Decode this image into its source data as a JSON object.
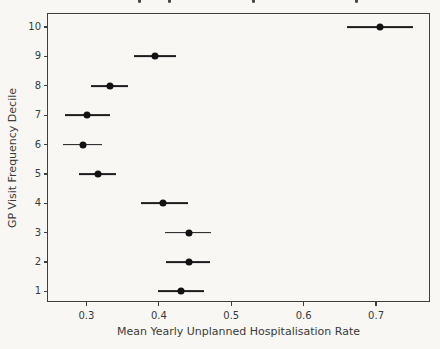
{
  "page": {
    "background_color": "#f8f7f4",
    "clipped_title": {
      "note": "title line cropped at top edge; only letter descenders visible",
      "descender_marks_x": [
        138,
        168,
        252,
        355
      ]
    }
  },
  "chart_data": {
    "type": "scatter",
    "subtype": "horizontal-errorbar",
    "title": "",
    "xlabel": "Mean Yearly Unplanned Hospitalisation Rate",
    "ylabel": "GP Visit Frequency Decile",
    "xlim": [
      0.2455,
      0.7745
    ],
    "ylim": [
      0.64,
      10.48
    ],
    "xticks": [
      0.3,
      0.4,
      0.5,
      0.6,
      0.7
    ],
    "yticks": [
      1,
      2,
      3,
      4,
      5,
      6,
      7,
      8,
      9,
      10
    ],
    "grid": false,
    "legend": false,
    "marker_color": "#121212",
    "errorbar_color": "#1d1d1d",
    "axis_color": "#3f3f3f",
    "text_color": "#3a3a3a",
    "points": [
      {
        "decile": 1,
        "rate": 0.431,
        "ci_low": 0.399,
        "ci_high": 0.462
      },
      {
        "decile": 2,
        "rate": 0.441,
        "ci_low": 0.41,
        "ci_high": 0.471
      },
      {
        "decile": 3,
        "rate": 0.441,
        "ci_low": 0.409,
        "ci_high": 0.472
      },
      {
        "decile": 4,
        "rate": 0.406,
        "ci_low": 0.376,
        "ci_high": 0.44
      },
      {
        "decile": 5,
        "rate": 0.316,
        "ci_low": 0.29,
        "ci_high": 0.341
      },
      {
        "decile": 6,
        "rate": 0.295,
        "ci_low": 0.267,
        "ci_high": 0.322
      },
      {
        "decile": 7,
        "rate": 0.301,
        "ci_low": 0.271,
        "ci_high": 0.332
      },
      {
        "decile": 8,
        "rate": 0.333,
        "ci_low": 0.306,
        "ci_high": 0.358
      },
      {
        "decile": 9,
        "rate": 0.395,
        "ci_low": 0.366,
        "ci_high": 0.424
      },
      {
        "decile": 10,
        "rate": 0.706,
        "ci_low": 0.66,
        "ci_high": 0.751
      }
    ]
  }
}
